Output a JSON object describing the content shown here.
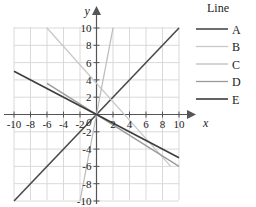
{
  "chart_data": {
    "type": "line",
    "title": "",
    "xlabel": "x",
    "ylabel": "y",
    "xlim": [
      -10,
      10
    ],
    "ylim": [
      -10,
      10
    ],
    "xticks": [
      -10,
      -8,
      -6,
      -4,
      -2,
      2,
      4,
      6,
      8,
      10
    ],
    "yticks": [
      -10,
      -8,
      -6,
      -4,
      -2,
      2,
      4,
      6,
      8,
      10
    ],
    "xtick_labels": [
      "-10",
      "-8",
      "-6",
      "-4",
      "-2",
      "2",
      "4",
      "6",
      "8",
      "10"
    ],
    "ytick_labels": [
      "-10",
      "-8",
      "-6",
      "-4",
      "-2",
      "2",
      "4",
      "6",
      "8",
      "10"
    ],
    "origin_label": "0",
    "grid": true,
    "grid_step": 2,
    "legend_position": "right",
    "legend_title": "Line",
    "series": [
      {
        "name": "A",
        "color": "#4a4a4a",
        "width": 1.6,
        "slope": 1,
        "intercept": 0,
        "x": [
          -10,
          10
        ],
        "y": [
          -10,
          10
        ]
      },
      {
        "name": "B",
        "color": "#c8c8c8",
        "width": 1.3,
        "slope": -1.07,
        "intercept": 3.6,
        "x": [
          -6,
          9
        ],
        "y": [
          10,
          -6
        ]
      },
      {
        "name": "C",
        "color": "#bdbdbd",
        "width": 1.3,
        "slope": 5,
        "intercept": 0,
        "x": [
          -2,
          2
        ],
        "y": [
          -10,
          10
        ]
      },
      {
        "name": "D",
        "color": "#9a9a9a",
        "width": 1.3,
        "slope": -0.6,
        "intercept": 0,
        "x": [
          -6,
          10
        ],
        "y": [
          3.6,
          -6
        ]
      },
      {
        "name": "E",
        "color": "#3d3d3d",
        "width": 1.6,
        "slope": -0.5,
        "intercept": 0,
        "x": [
          -10,
          10
        ],
        "y": [
          5,
          -5
        ]
      }
    ]
  },
  "legend": {
    "title": "Line",
    "entries": [
      {
        "label": "A",
        "color": "#4a4a4a"
      },
      {
        "label": "B",
        "color": "#c8c8c8"
      },
      {
        "label": "C",
        "color": "#bdbdbd"
      },
      {
        "label": "D",
        "color": "#9a9a9a"
      },
      {
        "label": "E",
        "color": "#3d3d3d"
      }
    ]
  },
  "axes": {
    "x_name": "x",
    "y_name": "y",
    "origin": "0"
  },
  "colors": {
    "grid": "#d9d9d9",
    "axis": "#555555",
    "text": "#222222",
    "background": "#ffffff"
  }
}
